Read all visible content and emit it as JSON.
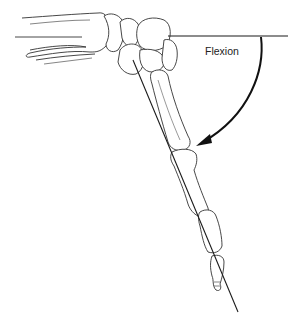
{
  "diagram": {
    "labels": {
      "flexion": "Flexion"
    },
    "colors": {
      "line": "#1a1a1a",
      "bone_outline": "#333333",
      "background": "#ffffff"
    },
    "reference_lines": {
      "horizontal": {
        "x1": 168,
        "y1": 36,
        "x2": 288,
        "y2": 36
      },
      "diagonal": {
        "x1": 133,
        "y1": 60,
        "x2": 238,
        "y2": 312
      }
    },
    "arc": {
      "start": [
        261,
        36
      ],
      "end": [
        197,
        145
      ],
      "arrow": true
    }
  }
}
